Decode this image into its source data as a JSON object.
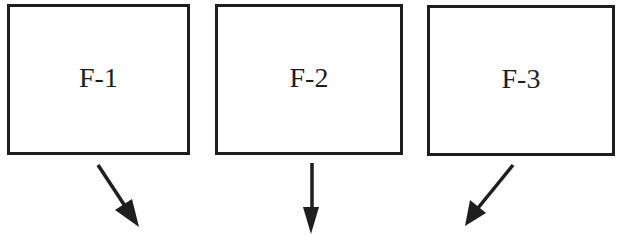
{
  "diagram": {
    "boxes": [
      {
        "id": "F-1",
        "label": "F-1"
      },
      {
        "id": "F-2",
        "label": "F-2"
      },
      {
        "id": "F-3",
        "label": "F-3"
      }
    ],
    "arrows": [
      {
        "from": "F-1",
        "direction": "down-right"
      },
      {
        "from": "F-2",
        "direction": "down"
      },
      {
        "from": "F-3",
        "direction": "down-left"
      }
    ],
    "colors": {
      "stroke": "#1e1e1e",
      "background": "#ffffff"
    }
  }
}
